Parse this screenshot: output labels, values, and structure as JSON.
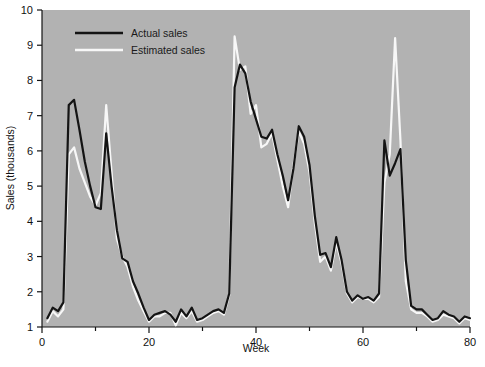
{
  "chart_data": {
    "type": "line",
    "title": "",
    "xlabel": "Week",
    "ylabel": "Sales (thousands)",
    "xlim": [
      0,
      80
    ],
    "ylim": [
      1,
      10
    ],
    "xticks": [
      0,
      20,
      40,
      60,
      80
    ],
    "xticks_minor": [
      10,
      30,
      50,
      70
    ],
    "yticks": [
      1,
      2,
      3,
      4,
      5,
      6,
      7,
      8,
      9,
      10
    ],
    "grid": false,
    "legend_position": "top-left",
    "plot_background": "#b2b2b2",
    "x": [
      1,
      2,
      3,
      4,
      5,
      6,
      7,
      8,
      9,
      10,
      11,
      12,
      13,
      14,
      15,
      16,
      17,
      18,
      19,
      20,
      21,
      22,
      23,
      24,
      25,
      26,
      27,
      28,
      29,
      30,
      31,
      32,
      33,
      34,
      35,
      36,
      37,
      38,
      39,
      40,
      41,
      42,
      43,
      44,
      45,
      46,
      47,
      48,
      49,
      50,
      51,
      52,
      53,
      54,
      55,
      56,
      57,
      58,
      59,
      60,
      61,
      62,
      63,
      64,
      65,
      66,
      67,
      68,
      69,
      70,
      71,
      72,
      73,
      74,
      75,
      76,
      77,
      78,
      79,
      80
    ],
    "series": [
      {
        "name": "Actual sales",
        "color": "#141414",
        "linewidth": 2.2,
        "values": [
          1.25,
          1.55,
          1.45,
          1.7,
          7.3,
          7.45,
          6.6,
          5.7,
          5.0,
          4.4,
          4.35,
          6.5,
          5.0,
          3.75,
          2.95,
          2.85,
          2.3,
          1.95,
          1.55,
          1.2,
          1.35,
          1.4,
          1.45,
          1.35,
          1.15,
          1.5,
          1.3,
          1.55,
          1.2,
          1.25,
          1.35,
          1.45,
          1.5,
          1.4,
          1.95,
          7.8,
          8.45,
          8.2,
          7.4,
          6.9,
          6.4,
          6.35,
          6.6,
          5.9,
          5.3,
          4.6,
          5.5,
          6.7,
          6.4,
          5.6,
          4.15,
          3.05,
          3.1,
          2.7,
          3.55,
          2.9,
          2.0,
          1.75,
          1.9,
          1.8,
          1.85,
          1.75,
          1.95,
          6.3,
          5.3,
          5.65,
          6.05,
          2.9,
          1.6,
          1.5,
          1.5,
          1.35,
          1.2,
          1.25,
          1.45,
          1.35,
          1.3,
          1.15,
          1.3,
          1.25
        ]
      },
      {
        "name": "Estimated sales",
        "color": "#f7f7f7",
        "linewidth": 2.2,
        "values": [
          1.15,
          1.45,
          1.3,
          1.5,
          5.9,
          6.1,
          5.5,
          5.1,
          4.7,
          4.45,
          4.8,
          7.3,
          5.4,
          3.5,
          3.0,
          2.7,
          2.15,
          1.75,
          1.45,
          1.15,
          1.3,
          1.3,
          1.4,
          1.4,
          1.05,
          1.4,
          1.25,
          1.45,
          1.15,
          1.2,
          1.3,
          1.4,
          1.45,
          1.35,
          1.9,
          9.25,
          8.3,
          8.4,
          7.05,
          7.3,
          6.1,
          6.2,
          6.5,
          5.75,
          5.0,
          4.4,
          5.6,
          6.55,
          6.2,
          5.4,
          3.95,
          2.85,
          3.0,
          2.6,
          3.4,
          2.8,
          1.95,
          1.7,
          1.85,
          1.8,
          1.8,
          1.7,
          1.85,
          5.1,
          5.9,
          9.2,
          6.3,
          2.3,
          1.5,
          1.4,
          1.4,
          1.3,
          1.15,
          1.2,
          1.35,
          1.3,
          1.25,
          1.1,
          1.25,
          1.2
        ]
      }
    ]
  },
  "legend": {
    "items": [
      {
        "label": "Actual sales",
        "color": "#141414"
      },
      {
        "label": "Estimated sales",
        "color": "#f7f7f7"
      }
    ]
  },
  "axes": {
    "y_title": "Sales (thousands)",
    "x_title": "Week",
    "y_tick_labels": [
      "10",
      "9",
      "8",
      "7",
      "6",
      "5",
      "4",
      "3",
      "2",
      "1"
    ],
    "x_tick_labels": [
      "0",
      "20",
      "40",
      "60",
      "80"
    ]
  }
}
